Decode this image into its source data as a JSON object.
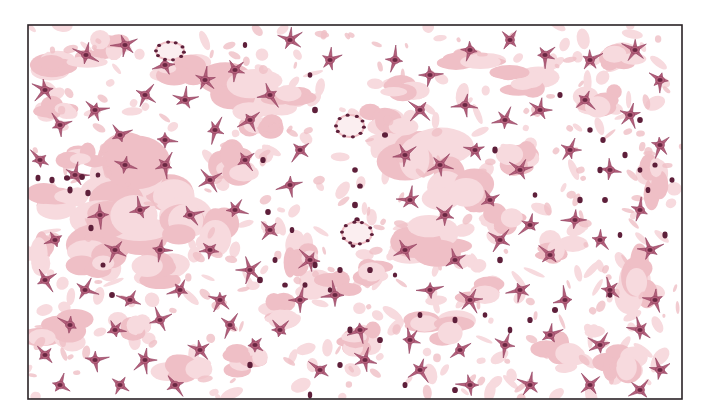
{
  "figure": {
    "frame": {
      "x": 28,
      "y": 25,
      "w": 654,
      "h": 374
    },
    "colors": {
      "background": "#ffffff",
      "frame": "#2a2226",
      "matrix_dark": "#efbfc6",
      "matrix_light": "#f7dade",
      "cell_body": "#b5617c",
      "cell_edge": "#8e3d5c",
      "nucleus": "#5e1f3a"
    },
    "matrix_patches": [
      [
        70,
        60,
        40,
        22
      ],
      [
        110,
        45,
        30,
        18
      ],
      [
        180,
        70,
        34,
        20
      ],
      [
        240,
        90,
        50,
        30
      ],
      [
        60,
        110,
        30,
        20
      ],
      [
        150,
        180,
        80,
        60
      ],
      [
        120,
        230,
        60,
        40
      ],
      [
        200,
        230,
        50,
        40
      ],
      [
        90,
        260,
        40,
        24
      ],
      [
        60,
        200,
        40,
        24
      ],
      [
        160,
        270,
        40,
        22
      ],
      [
        230,
        160,
        40,
        30
      ],
      [
        260,
        120,
        30,
        20
      ],
      [
        290,
        100,
        30,
        16
      ],
      [
        420,
        160,
        60,
        40
      ],
      [
        460,
        190,
        40,
        30
      ],
      [
        500,
        220,
        30,
        20
      ],
      [
        430,
        240,
        50,
        30
      ],
      [
        390,
        120,
        40,
        24
      ],
      [
        400,
        90,
        30,
        18
      ],
      [
        520,
        160,
        30,
        20
      ],
      [
        560,
        250,
        30,
        20
      ],
      [
        640,
        280,
        30,
        40
      ],
      [
        650,
        180,
        20,
        30
      ],
      [
        330,
        290,
        40,
        24
      ],
      [
        280,
        310,
        30,
        20
      ],
      [
        440,
        330,
        40,
        24
      ],
      [
        600,
        100,
        30,
        20
      ],
      [
        620,
        60,
        30,
        18
      ],
      [
        520,
        80,
        40,
        20
      ],
      [
        60,
        330,
        40,
        30
      ],
      [
        130,
        330,
        30,
        20
      ],
      [
        180,
        370,
        40,
        20
      ],
      [
        250,
        360,
        30,
        20
      ],
      [
        380,
        270,
        30,
        20
      ],
      [
        480,
        290,
        30,
        20
      ],
      [
        560,
        350,
        30,
        20
      ],
      [
        620,
        360,
        30,
        24
      ],
      [
        470,
        60,
        40,
        16
      ],
      [
        300,
        250,
        20,
        30
      ],
      [
        360,
        340,
        30,
        20
      ],
      [
        80,
        160,
        30,
        20
      ],
      [
        40,
        250,
        20,
        30
      ]
    ],
    "stellate_cells": [
      [
        86,
        55
      ],
      [
        125,
        45
      ],
      [
        165,
        65
      ],
      [
        205,
        80
      ],
      [
        235,
        70
      ],
      [
        45,
        90
      ],
      [
        60,
        125
      ],
      [
        95,
        110
      ],
      [
        145,
        95
      ],
      [
        185,
        100
      ],
      [
        120,
        135
      ],
      [
        165,
        140
      ],
      [
        215,
        130
      ],
      [
        250,
        120
      ],
      [
        40,
        160
      ],
      [
        75,
        175
      ],
      [
        125,
        165
      ],
      [
        165,
        165
      ],
      [
        210,
        180
      ],
      [
        245,
        160
      ],
      [
        140,
        210
      ],
      [
        100,
        215
      ],
      [
        190,
        215
      ],
      [
        235,
        210
      ],
      [
        55,
        240
      ],
      [
        115,
        250
      ],
      [
        160,
        250
      ],
      [
        210,
        250
      ],
      [
        45,
        280
      ],
      [
        85,
        290
      ],
      [
        130,
        300
      ],
      [
        180,
        290
      ],
      [
        220,
        300
      ],
      [
        70,
        325
      ],
      [
        115,
        330
      ],
      [
        160,
        320
      ],
      [
        230,
        325
      ],
      [
        45,
        355
      ],
      [
        95,
        360
      ],
      [
        145,
        360
      ],
      [
        200,
        350
      ],
      [
        255,
        345
      ],
      [
        60,
        385
      ],
      [
        120,
        385
      ],
      [
        175,
        385
      ],
      [
        290,
        40
      ],
      [
        330,
        60
      ],
      [
        270,
        95
      ],
      [
        300,
        150
      ],
      [
        290,
        185
      ],
      [
        270,
        230
      ],
      [
        310,
        260
      ],
      [
        250,
        270
      ],
      [
        300,
        300
      ],
      [
        335,
        295
      ],
      [
        360,
        330
      ],
      [
        280,
        330
      ],
      [
        320,
        370
      ],
      [
        365,
        360
      ],
      [
        410,
        340
      ],
      [
        395,
        60
      ],
      [
        430,
        75
      ],
      [
        470,
        50
      ],
      [
        510,
        40
      ],
      [
        545,
        55
      ],
      [
        590,
        60
      ],
      [
        635,
        50
      ],
      [
        660,
        80
      ],
      [
        420,
        110
      ],
      [
        465,
        105
      ],
      [
        505,
        120
      ],
      [
        540,
        110
      ],
      [
        585,
        100
      ],
      [
        630,
        115
      ],
      [
        660,
        145
      ],
      [
        405,
        155
      ],
      [
        440,
        165
      ],
      [
        475,
        150
      ],
      [
        520,
        170
      ],
      [
        570,
        150
      ],
      [
        610,
        170
      ],
      [
        410,
        200
      ],
      [
        445,
        215
      ],
      [
        490,
        200
      ],
      [
        530,
        225
      ],
      [
        575,
        220
      ],
      [
        640,
        210
      ],
      [
        405,
        250
      ],
      [
        455,
        260
      ],
      [
        500,
        240
      ],
      [
        550,
        255
      ],
      [
        600,
        240
      ],
      [
        650,
        250
      ],
      [
        430,
        290
      ],
      [
        470,
        300
      ],
      [
        520,
        290
      ],
      [
        565,
        300
      ],
      [
        610,
        290
      ],
      [
        655,
        300
      ],
      [
        420,
        370
      ],
      [
        460,
        350
      ],
      [
        505,
        345
      ],
      [
        550,
        335
      ],
      [
        600,
        345
      ],
      [
        640,
        330
      ],
      [
        660,
        370
      ],
      [
        470,
        385
      ],
      [
        530,
        385
      ],
      [
        590,
        385
      ],
      [
        640,
        390
      ]
    ],
    "free_nuclei": [
      [
        38,
        178
      ],
      [
        52,
        180
      ],
      [
        67,
        178
      ],
      [
        82,
        177
      ],
      [
        98,
        175
      ],
      [
        70,
        190
      ],
      [
        88,
        193
      ],
      [
        91,
        228
      ],
      [
        103,
        265
      ],
      [
        112,
        295
      ],
      [
        245,
        45
      ],
      [
        310,
        75
      ],
      [
        315,
        110
      ],
      [
        385,
        135
      ],
      [
        355,
        170
      ],
      [
        360,
        186
      ],
      [
        355,
        205
      ],
      [
        357,
        220
      ],
      [
        353,
        245
      ],
      [
        315,
        265
      ],
      [
        340,
        270
      ],
      [
        370,
        270
      ],
      [
        395,
        275
      ],
      [
        275,
        260
      ],
      [
        260,
        280
      ],
      [
        285,
        285
      ],
      [
        305,
        285
      ],
      [
        330,
        290
      ],
      [
        350,
        330
      ],
      [
        340,
        365
      ],
      [
        380,
        340
      ],
      [
        420,
        315
      ],
      [
        455,
        320
      ],
      [
        485,
        315
      ],
      [
        510,
        330
      ],
      [
        530,
        320
      ],
      [
        555,
        310
      ],
      [
        405,
        385
      ],
      [
        455,
        390
      ],
      [
        560,
        95
      ],
      [
        590,
        130
      ],
      [
        603,
        140
      ],
      [
        625,
        155
      ],
      [
        640,
        170
      ],
      [
        655,
        165
      ],
      [
        672,
        180
      ],
      [
        648,
        190
      ],
      [
        600,
        170
      ],
      [
        605,
        200
      ],
      [
        620,
        235
      ],
      [
        610,
        295
      ],
      [
        665,
        235
      ],
      [
        263,
        160
      ],
      [
        268,
        212
      ],
      [
        292,
        230
      ],
      [
        250,
        365
      ],
      [
        310,
        395
      ],
      [
        535,
        195
      ],
      [
        580,
        200
      ],
      [
        495,
        150
      ],
      [
        500,
        260
      ],
      [
        640,
        120
      ]
    ],
    "rings": [
      {
        "cx": 170,
        "cy": 51,
        "rx": 14,
        "ry": 9
      },
      {
        "cx": 350,
        "cy": 126,
        "rx": 14,
        "ry": 11
      },
      {
        "cx": 357,
        "cy": 233,
        "rx": 15,
        "ry": 11
      }
    ]
  }
}
